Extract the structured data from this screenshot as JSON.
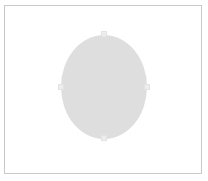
{
  "canvas": {
    "width": 208,
    "height": 181,
    "background_color": "#ffffff",
    "label": "drawing canvas"
  },
  "artboard": {
    "label": "artboard",
    "border_color": "#c9c9c9",
    "fill_color": "#ffffff",
    "x": 4,
    "y": 5,
    "width": 198,
    "height": 169
  },
  "shape": {
    "type": "ellipse",
    "label": "ellipse",
    "fill_color": "#dedede",
    "stroke_color": "none",
    "x": 61,
    "y": 35,
    "width": 86,
    "height": 104,
    "selected": true
  },
  "selection": {
    "handle_color": "#ededed",
    "handle_border_color": "#e3e3e3",
    "handles": [
      {
        "position": "top",
        "label": "top resize handle"
      },
      {
        "position": "right",
        "label": "right resize handle"
      },
      {
        "position": "bottom",
        "label": "bottom resize handle"
      },
      {
        "position": "left",
        "label": "left resize handle"
      }
    ]
  }
}
